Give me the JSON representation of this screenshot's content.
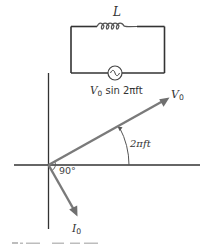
{
  "circuit": {
    "inductor_label": "L",
    "source_label": {
      "symbol": "V",
      "subscript": "0",
      "expression": " sin 2πft"
    }
  },
  "phasor_diagram": {
    "voltage_phasor": {
      "symbol": "V",
      "subscript": "0"
    },
    "current_phasor": {
      "symbol": "I",
      "subscript": "0"
    },
    "phase_angle_label": "2πft",
    "right_angle_label": "90°"
  },
  "colors": {
    "wire": "#333333",
    "phasor_arrow": "#777777",
    "axis": "#333333",
    "text": "#333333"
  }
}
